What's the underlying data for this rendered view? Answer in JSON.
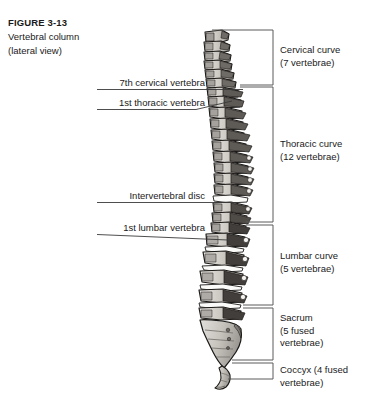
{
  "figure": {
    "number": "FIGURE 3-13",
    "title": "Vertebral column",
    "subtitle": "(lateral view)"
  },
  "left_labels": [
    {
      "key": "seventh-cervical-vertebra",
      "text": "7th cervical vertebra"
    },
    {
      "key": "first-thoracic-vertebra",
      "text": "1st thoracic vertebra"
    },
    {
      "key": "intervertebral-disc",
      "text": "Intervertebral disc"
    },
    {
      "key": "first-lumbar-vertebra",
      "text": "1st lumbar vertebra"
    }
  ],
  "right_regions": [
    {
      "key": "cervical-curve",
      "line1": "Cervical curve",
      "line2": "(7 vertebrae)",
      "line3": ""
    },
    {
      "key": "thoracic-curve",
      "line1": "Thoracic curve",
      "line2": "(12 vertebrae)",
      "line3": ""
    },
    {
      "key": "lumbar-curve",
      "line1": "Lumbar curve",
      "line2": "(5 vertebrae)",
      "line3": ""
    },
    {
      "key": "sacrum",
      "line1": "Sacrum",
      "line2": "(5 fused",
      "line3": "vertebrae)"
    },
    {
      "key": "coccyx",
      "line1": "Coccyx (4 fused",
      "line2": "vertebrae)",
      "line3": ""
    }
  ],
  "colors": {
    "ink": "#1a1a1a",
    "rule": "#3a3a3a",
    "bracket": "#5a5a5a",
    "bone_light": "#d8d6d1",
    "bone_mid": "#b9b6b0",
    "bone_shadow": "#8d8a85",
    "bone_dark": "#4a4743",
    "outline": "#1c1a18",
    "background": "#ffffff"
  }
}
